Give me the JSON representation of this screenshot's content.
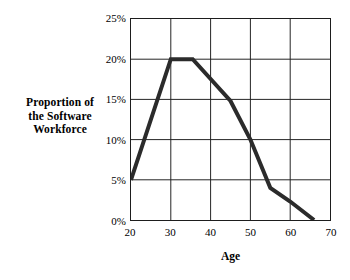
{
  "chart_data": {
    "type": "line",
    "title": "",
    "xlabel": "Age",
    "ylabel": "Proportion of the Software Workforce",
    "ylabel_lines": [
      "Proportion of",
      "the Software",
      "Workforce"
    ],
    "x": [
      20,
      30,
      35.5,
      45,
      50,
      55,
      60,
      66
    ],
    "values": [
      5,
      20,
      20,
      14.8,
      10,
      4,
      2.3,
      0
    ],
    "series": [
      {
        "name": "Proportion of the Software Workforce",
        "points": [
          {
            "age": 20,
            "proportion": 5
          },
          {
            "age": 30,
            "proportion": 20
          },
          {
            "age": 35.5,
            "proportion": 20
          },
          {
            "age": 45,
            "proportion": 14.8
          },
          {
            "age": 50,
            "proportion": 10
          },
          {
            "age": 55,
            "proportion": 4
          },
          {
            "age": 60,
            "proportion": 2.3
          },
          {
            "age": 66,
            "proportion": 0
          }
        ]
      }
    ],
    "xlim": [
      20,
      70
    ],
    "ylim": [
      0,
      25
    ],
    "xticks": [
      20,
      30,
      40,
      50,
      60,
      70
    ],
    "yticks": [
      0,
      5,
      10,
      15,
      20,
      25
    ],
    "xtick_labels": [
      "20",
      "30",
      "40",
      "50",
      "60",
      "70"
    ],
    "ytick_labels": [
      "0%",
      "5%",
      "10%",
      "15%",
      "20%",
      "25%"
    ],
    "grid": true,
    "legend": false,
    "line_color": "#2b2b2b",
    "line_width": 4,
    "grid_color": "#222222",
    "frame_color": "#1d1d1d",
    "background": "#ffffff"
  }
}
